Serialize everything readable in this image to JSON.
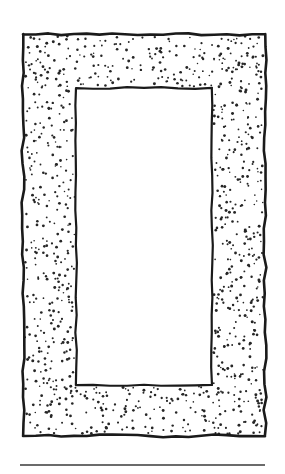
{
  "page": {
    "width": 285,
    "height": 474,
    "background_color": "#ffffff",
    "caption": ""
  },
  "figure": {
    "name": "stippled-rectangular-frame-cross-section",
    "ink_color": "#1a1a1a",
    "stipple_color": "#262626",
    "fill_color": "#ffffff",
    "outer_rect": {
      "name": "outer-boundary",
      "x": 23,
      "y": 34,
      "width": 242,
      "height": 402,
      "stroke_width": 2.6,
      "hand_drawn": true
    },
    "inner_rect": {
      "name": "inner-opening",
      "x": 76,
      "y": 88,
      "width": 136,
      "height": 297,
      "stroke_width": 2.2,
      "hand_drawn": true
    },
    "stipple": {
      "name": "stipple-fill",
      "dot_radius_min": 0.75,
      "dot_radius_max": 1.5,
      "dot_count": 980,
      "seed": 20240517,
      "region": "between outer-boundary and inner-opening"
    }
  },
  "footer_rule": {
    "name": "horizontal-rule",
    "x1": 20,
    "x2": 265,
    "y": 465,
    "stroke_width": 1.6,
    "color": "#3a3a3a"
  },
  "labels": {
    "figure_title": "",
    "figure_number": "",
    "annotations": []
  }
}
